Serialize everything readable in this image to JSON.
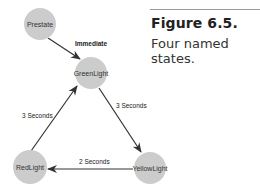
{
  "figure": {
    "title": "Figure 6.5.",
    "caption": "Four named states."
  },
  "diagram": {
    "nodes": [
      {
        "id": "prestate",
        "label": "Prestate",
        "cx": 40,
        "cy": 24
      },
      {
        "id": "greenlight",
        "label": "GreenLight",
        "cx": 91,
        "cy": 73
      },
      {
        "id": "redlight",
        "label": "RedLight",
        "cx": 30,
        "cy": 166
      },
      {
        "id": "yellowlight",
        "label": "YellowLight",
        "cx": 150,
        "cy": 167
      }
    ],
    "edges": [
      {
        "from": "prestate",
        "to": "greenlight",
        "label": "Immediate"
      },
      {
        "from": "greenlight",
        "to": "yellowlight",
        "label": "3 Seconds"
      },
      {
        "from": "yellowlight",
        "to": "redlight",
        "label": "2 Seconds"
      },
      {
        "from": "redlight",
        "to": "greenlight",
        "label": "3 Seconds"
      }
    ],
    "node_color": "#cccccc",
    "edge_color": "#333333"
  }
}
